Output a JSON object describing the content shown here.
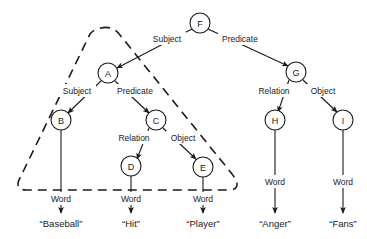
{
  "diagram": {
    "type": "semantic-network-parse-tree",
    "nodes": [
      {
        "id": "F",
        "label": "F",
        "cx": 200,
        "cy": 23,
        "r": 10
      },
      {
        "id": "A",
        "label": "A",
        "cx": 108,
        "cy": 73,
        "r": 10
      },
      {
        "id": "G",
        "label": "G",
        "cx": 296,
        "cy": 72,
        "r": 10
      },
      {
        "id": "B",
        "label": "B",
        "cx": 61,
        "cy": 120,
        "r": 10
      },
      {
        "id": "C",
        "label": "C",
        "cx": 156,
        "cy": 120,
        "r": 10
      },
      {
        "id": "H",
        "label": "H",
        "cx": 275,
        "cy": 120,
        "r": 10
      },
      {
        "id": "I",
        "label": "I",
        "cx": 343,
        "cy": 120,
        "r": 10
      },
      {
        "id": "D",
        "label": "D",
        "cx": 131,
        "cy": 166,
        "r": 10
      },
      {
        "id": "E",
        "label": "E",
        "cx": 203,
        "cy": 167,
        "r": 10
      }
    ],
    "edges": [
      {
        "from": "F",
        "to": "A",
        "label": "Subject",
        "label_x": 167,
        "label_y": 39
      },
      {
        "from": "F",
        "to": "G",
        "label": "Predicate",
        "label_x": 240,
        "label_y": 39
      },
      {
        "from": "A",
        "to": "B",
        "label": "Subject",
        "label_x": 77,
        "label_y": 91
      },
      {
        "from": "A",
        "to": "C",
        "label": "Predicate",
        "label_x": 135,
        "label_y": 91
      },
      {
        "from": "C",
        "to": "D",
        "label": "Relation",
        "label_x": 134,
        "label_y": 138
      },
      {
        "from": "C",
        "to": "E",
        "label": "Object",
        "label_x": 183,
        "label_y": 138
      },
      {
        "from": "G",
        "to": "H",
        "label": "Relation",
        "label_x": 274,
        "label_y": 91
      },
      {
        "from": "G",
        "to": "I",
        "label": "Object",
        "label_x": 323,
        "label_y": 91
      },
      {
        "from": "B",
        "to": "w-baseball",
        "label": "Word",
        "label_x": 61,
        "label_y": 199
      },
      {
        "from": "D",
        "to": "w-hit",
        "label": "Word",
        "label_x": 131,
        "label_y": 199
      },
      {
        "from": "E",
        "to": "w-player",
        "label": "Word",
        "label_x": 203,
        "label_y": 199
      },
      {
        "from": "H",
        "to": "w-anger",
        "label": "Word",
        "label_x": 275,
        "label_y": 182
      },
      {
        "from": "I",
        "to": "w-fans",
        "label": "Word",
        "label_x": 343,
        "label_y": 182
      }
    ],
    "terminals": [
      {
        "id": "w-baseball",
        "text": "“Baseball”",
        "x": 61,
        "y": 223
      },
      {
        "id": "w-hit",
        "text": "“Hit”",
        "x": 131,
        "y": 223
      },
      {
        "id": "w-player",
        "text": "“Player”",
        "x": 203,
        "y": 223
      },
      {
        "id": "w-anger",
        "text": "“Anger”",
        "x": 275,
        "y": 223
      },
      {
        "id": "w-fans",
        "text": "“Fans”",
        "x": 343,
        "y": 223
      }
    ],
    "boundary": {
      "name": "dashed-subgraph-boundary",
      "style": "dashed",
      "encloses": [
        "A",
        "B",
        "C",
        "D",
        "E"
      ]
    },
    "colors": {
      "stroke": "#1a1a1a",
      "node_fill": "#ffffff",
      "background": "#ffffff"
    }
  }
}
